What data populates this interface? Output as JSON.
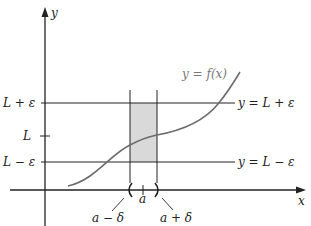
{
  "diagram": {
    "axes": {
      "x_label": "x",
      "y_label": "y"
    },
    "curve_label": "y = f(x)",
    "y_ticks": [
      {
        "label": "L + ε",
        "y": 103
      },
      {
        "label": "L",
        "y": 136
      },
      {
        "label": "L − ε",
        "y": 162
      }
    ],
    "horizontal_lines": [
      {
        "label": "y = L + ε",
        "y": 103
      },
      {
        "label": "y = L − ε",
        "y": 162
      }
    ],
    "x_marks": [
      {
        "label": "a − δ",
        "x": 130
      },
      {
        "label": "a",
        "x": 143
      },
      {
        "label": "a + δ",
        "x": 157
      }
    ],
    "colors": {
      "axis": "#222222",
      "curve": "#6b6b6b",
      "shade": "#d9d9d9"
    }
  }
}
